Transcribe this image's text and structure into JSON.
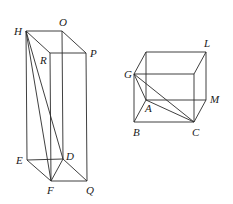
{
  "figures": [
    {
      "name": "tall-prism",
      "vertices": {
        "H": {
          "label": "H",
          "x": 26,
          "y": 31,
          "lx": 14,
          "ly": 35
        },
        "O": {
          "label": "O",
          "x": 62,
          "y": 31,
          "lx": 59,
          "ly": 26
        },
        "P": {
          "label": "P",
          "x": 86,
          "y": 53,
          "lx": 90,
          "ly": 57
        },
        "R": {
          "label": "R",
          "x": 50,
          "y": 53,
          "lx": 40,
          "ly": 64
        },
        "E": {
          "label": "E",
          "x": 27,
          "y": 160,
          "lx": 16,
          "ly": 164
        },
        "D": {
          "label": "D",
          "x": 63,
          "y": 159,
          "lx": 66,
          "ly": 160
        },
        "F": {
          "label": "F",
          "x": 51,
          "y": 181,
          "lx": 47,
          "ly": 194
        },
        "Q": {
          "label": "Q",
          "x": 87,
          "y": 181,
          "lx": 86,
          "ly": 194
        }
      },
      "edges": [
        [
          "H",
          "O"
        ],
        [
          "O",
          "P"
        ],
        [
          "P",
          "R"
        ],
        [
          "R",
          "H"
        ],
        [
          "H",
          "E"
        ],
        [
          "O",
          "D"
        ],
        [
          "P",
          "Q"
        ],
        [
          "R",
          "F"
        ],
        [
          "E",
          "D"
        ],
        [
          "D",
          "Q"
        ],
        [
          "Q",
          "F"
        ],
        [
          "F",
          "E"
        ],
        [
          "H",
          "F"
        ],
        [
          "H",
          "D"
        ],
        [
          "D",
          "F"
        ]
      ]
    },
    {
      "name": "cube",
      "vertices": {
        "T1": {
          "label": "",
          "x": 146,
          "y": 52
        },
        "L": {
          "label": "L",
          "x": 206,
          "y": 52,
          "lx": 204,
          "ly": 47
        },
        "G": {
          "label": "G",
          "x": 134,
          "y": 74,
          "lx": 124,
          "ly": 78
        },
        "T4": {
          "label": "",
          "x": 194,
          "y": 74
        },
        "A": {
          "label": "A",
          "x": 146,
          "y": 100,
          "lx": 145,
          "ly": 112
        },
        "M": {
          "label": "M",
          "x": 206,
          "y": 100,
          "lx": 210,
          "ly": 103
        },
        "B": {
          "label": "B",
          "x": 134,
          "y": 122,
          "lx": 133,
          "ly": 136
        },
        "C": {
          "label": "C",
          "x": 194,
          "y": 122,
          "lx": 192,
          "ly": 136
        }
      },
      "edges": [
        [
          "T1",
          "L"
        ],
        [
          "L",
          "T4"
        ],
        [
          "T4",
          "G"
        ],
        [
          "G",
          "T1"
        ],
        [
          "T1",
          "A"
        ],
        [
          "L",
          "M"
        ],
        [
          "T4",
          "C"
        ],
        [
          "G",
          "B"
        ],
        [
          "A",
          "M"
        ],
        [
          "M",
          "C"
        ],
        [
          "C",
          "B"
        ],
        [
          "B",
          "A"
        ],
        [
          "G",
          "A"
        ],
        [
          "G",
          "C"
        ],
        [
          "A",
          "C"
        ]
      ]
    }
  ]
}
